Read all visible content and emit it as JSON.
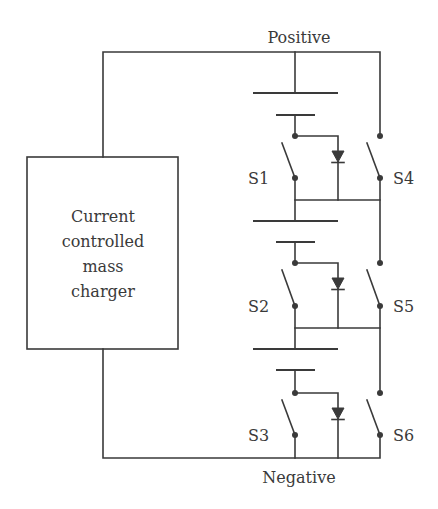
{
  "diagram": {
    "rails": {
      "positive_label": "Positive",
      "negative_label": "Negative"
    },
    "charger": {
      "lines": [
        "Current",
        "controlled",
        "mass",
        "charger"
      ]
    },
    "switches": {
      "s1": "S1",
      "s2": "S2",
      "s3": "S3",
      "s4": "S4",
      "s5": "S5",
      "s6": "S6"
    },
    "cells": [
      {
        "name": "cell-1",
        "long_plate_y": 93,
        "short_plate_y": 115
      },
      {
        "name": "cell-2",
        "long_plate_y": 221,
        "short_plate_y": 242
      },
      {
        "name": "cell-3",
        "long_plate_y": 349,
        "short_plate_y": 370
      }
    ],
    "colors": {
      "line": "#3a3a3a",
      "background": "#ffffff"
    }
  }
}
